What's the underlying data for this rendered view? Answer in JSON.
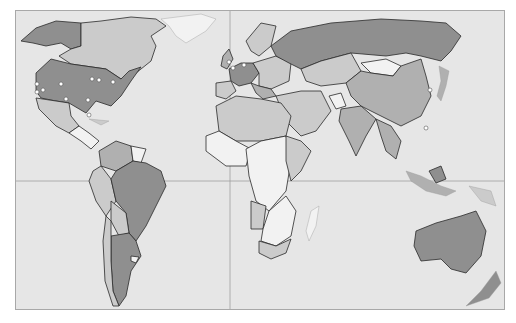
{
  "map": {
    "type": "world-choropleth",
    "projection": "equirectangular-like",
    "colors": {
      "ocean": "#e6e6e6",
      "frame_border": "#a8a8a8",
      "dark_category": "#8f8f8f",
      "mid_category": "#b0b0b0",
      "light_category": "#cbcbcb",
      "pale_category": "#f2f2f2",
      "city_marker": "#ffffff"
    },
    "gridlines": {
      "equator": true,
      "prime_meridian": true
    },
    "markers": {
      "north_america": [
        {
          "id": "seattle"
        },
        {
          "id": "san-francisco"
        },
        {
          "id": "los-angeles"
        },
        {
          "id": "denver"
        },
        {
          "id": "dallas"
        },
        {
          "id": "chicago"
        },
        {
          "id": "detroit"
        },
        {
          "id": "new-york"
        },
        {
          "id": "atlanta"
        },
        {
          "id": "miami"
        }
      ],
      "europe": [
        {
          "id": "london"
        },
        {
          "id": "paris"
        },
        {
          "id": "frankfurt"
        }
      ],
      "asia": [
        {
          "id": "tokyo"
        },
        {
          "id": "hong-kong"
        }
      ]
    }
  }
}
